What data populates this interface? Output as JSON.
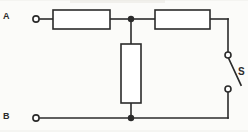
{
  "diagram": {
    "type": "electrical-schematic",
    "width": 248,
    "height": 132,
    "background_color": "#fbfbf9",
    "line_color": "#2b2b2b",
    "terminals": [
      {
        "id": "A",
        "label": "A",
        "position": "top-left",
        "x": 36,
        "y": 19,
        "marker": "open-circle"
      },
      {
        "id": "B",
        "label": "B",
        "position": "bottom-left",
        "x": 36,
        "y": 118,
        "marker": "open-circle"
      }
    ],
    "components": [
      {
        "id": "R1",
        "type": "resistor",
        "orientation": "horizontal",
        "label": "",
        "x": 53,
        "y": 10,
        "w": 57,
        "h": 19
      },
      {
        "id": "R2",
        "type": "resistor",
        "orientation": "horizontal",
        "label": "",
        "x": 155,
        "y": 10,
        "w": 55,
        "h": 19
      },
      {
        "id": "R3",
        "type": "resistor",
        "orientation": "vertical",
        "label": "",
        "x": 121,
        "y": 44,
        "w": 20,
        "h": 59
      },
      {
        "id": "S",
        "type": "switch",
        "state": "open",
        "label": "S",
        "terminal_top": {
          "x": 228,
          "y": 57
        },
        "terminal_bottom": {
          "x": 228,
          "y": 88
        },
        "blade_end": {
          "x": 240,
          "y": 84
        }
      }
    ],
    "junctions": [
      {
        "id": "node-top",
        "x": 131,
        "y": 19,
        "marker": "filled-dot"
      },
      {
        "id": "node-bottom",
        "x": 131,
        "y": 118,
        "marker": "filled-dot"
      }
    ],
    "wires": [
      {
        "id": "wire-a-to-r1",
        "points": "40,19 53,19"
      },
      {
        "id": "wire-r1-to-node-top",
        "points": "110,19 131,19"
      },
      {
        "id": "wire-node-top-to-r2",
        "points": "131,19 155,19"
      },
      {
        "id": "wire-r2-to-right-rail",
        "points": "210,19 228,19"
      },
      {
        "id": "wire-right-rail-down-to-switch",
        "points": "228,19 228,57"
      },
      {
        "id": "wire-switch-down-to-bottom",
        "points": "228,88 228,118"
      },
      {
        "id": "wire-bottom-rail-right",
        "points": "131,118 228,118"
      },
      {
        "id": "wire-b-to-node-bottom",
        "points": "40,118 131,118"
      },
      {
        "id": "wire-node-top-to-r3",
        "points": "131,19 131,44"
      },
      {
        "id": "wire-r3-to-node-bottom",
        "points": "131,103 131,118"
      }
    ]
  }
}
